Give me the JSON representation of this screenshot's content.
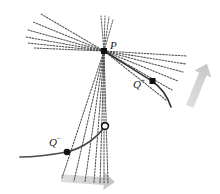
{
  "figure": {
    "name": "secant-lines-limit-diagram",
    "background": "#ffffff",
    "width": 220,
    "height": 194,
    "colors": {
      "ink": "#2b2b2b",
      "dotted": "#5a5a5a",
      "curve": "#3a3a3a",
      "arrow": "#cfcfcf",
      "point_fill": "#111111",
      "point_open_fill": "#ffffff"
    }
  },
  "labels": {
    "p": {
      "text": "P",
      "sup": "",
      "x": 110,
      "y": 39
    },
    "q_plus": {
      "text": "Q",
      "sup": "+",
      "x": 133,
      "y": 78
    },
    "q_minus": {
      "text": "Q",
      "sup": "−",
      "x": 49,
      "y": 136
    }
  },
  "points": [
    {
      "name": "point-p",
      "label": "P",
      "x": 104,
      "y": 51,
      "style": "filled-square"
    },
    {
      "name": "point-q-plus",
      "label": "Q+",
      "x": 152,
      "y": 81,
      "style": "filled-square"
    },
    {
      "name": "point-q-minus",
      "label": "Q-",
      "x": 67,
      "y": 152,
      "style": "filled-square"
    },
    {
      "name": "point-open-circle",
      "label": "",
      "x": 105,
      "y": 126,
      "style": "open-circle"
    }
  ],
  "curves": [
    {
      "name": "curve-through-q-plus",
      "kind": "solid",
      "path": "M 104 51 C 122 62 140 74 152 81 C 162 88 168 98 171 107"
    },
    {
      "name": "curve-through-q-minus",
      "kind": "solid",
      "path": "M 20 157 C 38 157 56 154 67 152 C 82 148 96 138 105 126"
    }
  ],
  "secant_fans": {
    "upper_left": {
      "name": "secant-fan-upper-left",
      "count": 6,
      "from": {
        "x": 104,
        "y": 51
      },
      "endpoints": [
        {
          "x": 41,
          "y": 14
        },
        {
          "x": 33,
          "y": 22
        },
        {
          "x": 28,
          "y": 30
        },
        {
          "x": 26,
          "y": 37
        },
        {
          "x": 28,
          "y": 43
        },
        {
          "x": 32,
          "y": 47
        }
      ]
    },
    "lower_right": {
      "name": "secant-fan-lower-right",
      "count": 6,
      "from": {
        "x": 104,
        "y": 51
      },
      "endpoints": [
        {
          "x": 187,
          "y": 56
        },
        {
          "x": 186,
          "y": 64
        },
        {
          "x": 183,
          "y": 72
        },
        {
          "x": 178,
          "y": 81
        },
        {
          "x": 172,
          "y": 90
        },
        {
          "x": 166,
          "y": 100
        }
      ]
    },
    "lower_left": {
      "name": "secant-fan-lower-left",
      "count": 7,
      "from": {
        "x": 104,
        "y": 51
      },
      "endpoints": [
        {
          "x": 62,
          "y": 178
        },
        {
          "x": 74,
          "y": 180
        },
        {
          "x": 85,
          "y": 181
        },
        {
          "x": 94,
          "y": 182
        },
        {
          "x": 100,
          "y": 182
        },
        {
          "x": 104,
          "y": 182
        },
        {
          "x": 107,
          "y": 182
        }
      ]
    },
    "upper_right_stub": {
      "name": "secant-fan-upper-stub",
      "count": 4,
      "from": {
        "x": 104,
        "y": 51
      },
      "endpoints": [
        {
          "x": 101,
          "y": 16
        },
        {
          "x": 105,
          "y": 16
        },
        {
          "x": 109,
          "y": 17
        },
        {
          "x": 113,
          "y": 19
        }
      ]
    }
  },
  "motion_arrows": [
    {
      "name": "motion-arrow-right",
      "direction": "up-right",
      "x": 196,
      "y": 88,
      "length": 42,
      "rotation": -68
    },
    {
      "name": "motion-arrow-bottom",
      "direction": "right",
      "x": 88,
      "y": 180,
      "length": 52,
      "rotation": 4
    }
  ]
}
